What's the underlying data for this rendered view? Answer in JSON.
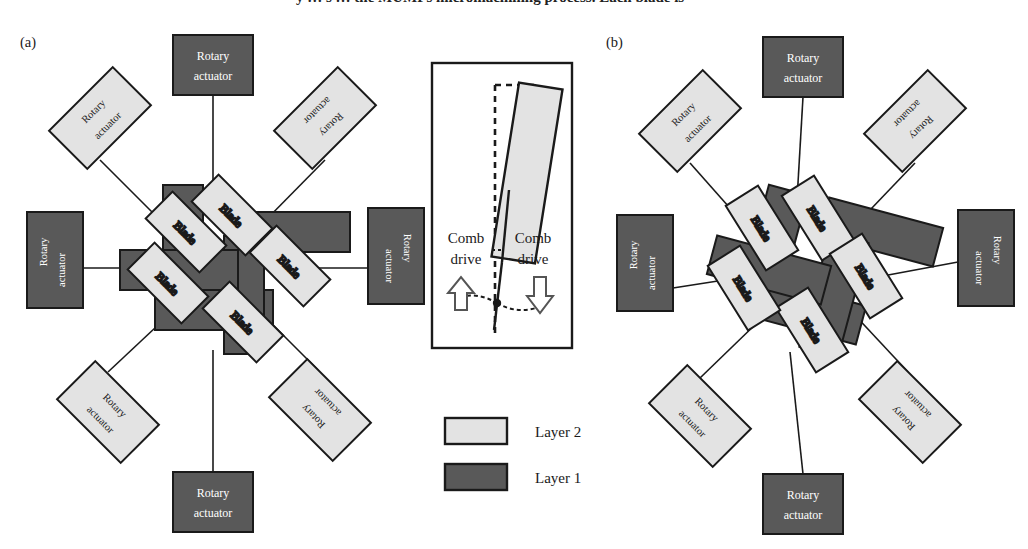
{
  "figure": {
    "cropped_caption_fragment": "y    …  s  …  the MUMPs micromachining process. Each blade is",
    "panels": [
      {
        "id": "a",
        "label": "(a)",
        "state": "open aperture"
      },
      {
        "id": "b",
        "label": "(b)",
        "state": "closed aperture"
      }
    ]
  },
  "colors": {
    "layer2_fill": "#e3e3e3",
    "layer1_fill": "#595959",
    "outline": "#1a1a1a",
    "page_background": "#ffffff",
    "dark_text": "#ffffff",
    "light_text": "#1a1a1a"
  },
  "labels": {
    "rotary_actuator_line1": "Rotary",
    "rotary_actuator_line2": "actuator",
    "blade": "Blade",
    "comb_line1": "Comb",
    "comb_line2": "drive"
  },
  "legend": {
    "items": [
      {
        "label": "Layer 2",
        "fill": "#e3e3e3",
        "layer": 2
      },
      {
        "label": "Layer 1",
        "fill": "#595959",
        "layer": 1
      }
    ]
  },
  "inset": {
    "title_absent": true,
    "comb_drive_left": {
      "label_line1": "Comb",
      "label_line2": "drive",
      "arrow": "up-arrow"
    },
    "comb_drive_right": {
      "label_line1": "Comb",
      "label_line2": "drive",
      "arrow": "down-arrow"
    },
    "blade_fill": "#e3e3e3",
    "reference_line": "dashed-vertical",
    "pivot": "pivot-dot"
  },
  "panel_a": {
    "label": "(a)",
    "blade_count": 5,
    "actuator_count": 8,
    "actuators": [
      {
        "index": 0,
        "position": "top",
        "layer": 1,
        "rotation": 0,
        "orientation": "horizontal"
      },
      {
        "index": 1,
        "position": "top-left",
        "layer": 2,
        "rotation": -45,
        "orientation": "diagonal"
      },
      {
        "index": 2,
        "position": "top-right",
        "layer": 2,
        "rotation": 45,
        "orientation": "diagonal"
      },
      {
        "index": 3,
        "position": "left",
        "layer": 1,
        "rotation": -90,
        "orientation": "vertical"
      },
      {
        "index": 4,
        "position": "right",
        "layer": 1,
        "rotation": 90,
        "orientation": "vertical"
      },
      {
        "index": 5,
        "position": "bottom-left",
        "layer": 2,
        "rotation": 45,
        "orientation": "diagonal"
      },
      {
        "index": 6,
        "position": "bottom-right",
        "layer": 2,
        "rotation": 225,
        "orientation": "diagonal"
      },
      {
        "index": 7,
        "position": "bottom",
        "layer": 1,
        "rotation": 0,
        "orientation": "horizontal"
      }
    ],
    "blades": [
      {
        "index": 0,
        "label": "Blade",
        "layer": 2,
        "rotation": 45
      },
      {
        "index": 1,
        "label": "Blade",
        "layer": 2,
        "rotation": 45
      },
      {
        "index": 2,
        "label": "Blade",
        "layer": 2,
        "rotation": 45
      },
      {
        "index": 3,
        "label": "Blade",
        "layer": 2,
        "rotation": 45
      },
      {
        "index": 4,
        "label": "Blade",
        "layer": 2,
        "rotation": 45
      }
    ]
  },
  "panel_b": {
    "label": "(b)",
    "blade_count": 5,
    "actuator_count": 8,
    "actuators": [
      {
        "index": 0,
        "position": "top",
        "layer": 1,
        "rotation": 0,
        "orientation": "horizontal"
      },
      {
        "index": 1,
        "position": "top-left",
        "layer": 2,
        "rotation": -45,
        "orientation": "diagonal"
      },
      {
        "index": 2,
        "position": "top-right",
        "layer": 2,
        "rotation": 45,
        "orientation": "diagonal"
      },
      {
        "index": 3,
        "position": "left",
        "layer": 1,
        "rotation": -90,
        "orientation": "vertical"
      },
      {
        "index": 4,
        "position": "right",
        "layer": 1,
        "rotation": 90,
        "orientation": "vertical"
      },
      {
        "index": 5,
        "position": "bottom-left",
        "layer": 2,
        "rotation": 45,
        "orientation": "diagonal"
      },
      {
        "index": 6,
        "position": "bottom-right",
        "layer": 2,
        "rotation": 225,
        "orientation": "diagonal"
      },
      {
        "index": 7,
        "position": "bottom",
        "layer": 1,
        "rotation": 0,
        "orientation": "horizontal"
      }
    ],
    "blades": [
      {
        "index": 0,
        "label": "Blade",
        "layer": 2,
        "rotation": 60
      },
      {
        "index": 1,
        "label": "Blade",
        "layer": 2,
        "rotation": 60
      },
      {
        "index": 2,
        "label": "Blade",
        "layer": 2,
        "rotation": 60
      },
      {
        "index": 3,
        "label": "Blade",
        "layer": 2,
        "rotation": 60
      },
      {
        "index": 4,
        "label": "Blade",
        "layer": 2,
        "rotation": 60
      }
    ]
  }
}
